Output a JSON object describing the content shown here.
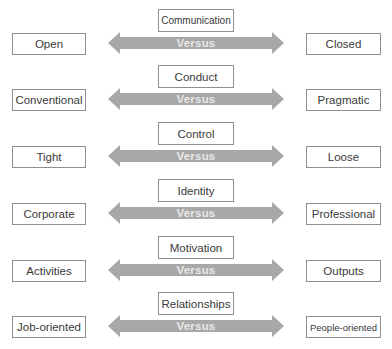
{
  "colors": {
    "arrow_fill": "#a8a8a8",
    "box_border": "#8f8f8f",
    "text": "#3a3a3a",
    "versus_text": "#e9e9e9"
  },
  "rows": [
    {
      "dimension": "Communication",
      "left": "Open",
      "right": "Closed",
      "connector": "Versus"
    },
    {
      "dimension": "Conduct",
      "left": "Conventional",
      "right": "Pragmatic",
      "connector": "Versus"
    },
    {
      "dimension": "Control",
      "left": "Tight",
      "right": "Loose",
      "connector": "Versus"
    },
    {
      "dimension": "Identity",
      "left": "Corporate",
      "right": "Professional",
      "connector": "Versus"
    },
    {
      "dimension": "Motivation",
      "left": "Activities",
      "right": "Outputs",
      "connector": "Versus"
    },
    {
      "dimension": "Relationships",
      "left": "Job-oriented",
      "right": "People-oriented",
      "connector": "Versus"
    }
  ]
}
